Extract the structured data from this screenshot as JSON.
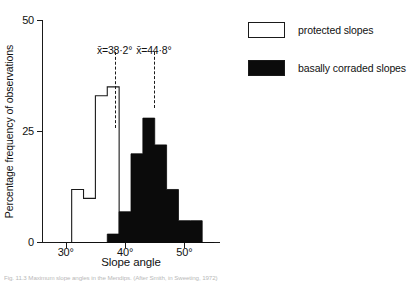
{
  "figure": {
    "caption": "Fig. 11.3  Maximum slope angles in the Mendips. (After Smith, in Sweeting, 1972)"
  },
  "axes": {
    "y_title": "Percentage frequency of observations",
    "x_title": "Slope angle",
    "y_ticks": [
      "0",
      "25",
      "50"
    ],
    "x_ticks": [
      "30°",
      "40°",
      "50°"
    ]
  },
  "annotations": {
    "mean_protected": {
      "symbol": "x̄",
      "eq": "=",
      "value": "38·2°",
      "full": "x̄=38·2°"
    },
    "mean_corraded": {
      "symbol": "x̄",
      "eq": "=",
      "value": "44·8°",
      "full": "x̄=44·8°"
    }
  },
  "legend": {
    "items": [
      {
        "label": "protected slopes",
        "swatch": "open",
        "color": "#ffffff"
      },
      {
        "label": "basally corraded slopes",
        "swatch": "filled",
        "color": "#0b0b0b"
      }
    ]
  },
  "chart_data": {
    "type": "bar",
    "subtype": "histogram",
    "title": "",
    "xlabel": "Slope angle",
    "ylabel": "Percentage frequency of observations",
    "xlim": [
      26,
      56
    ],
    "ylim": [
      0,
      50
    ],
    "ytick_values": [
      0,
      25,
      50
    ],
    "xtick_values": [
      30,
      40,
      50
    ],
    "xtick_labels": [
      "30°",
      "40°",
      "50°"
    ],
    "grid": false,
    "legend_position": "right-outside",
    "bin_width": 2,
    "bin_starts": [
      29,
      31,
      33,
      35,
      37,
      39,
      41,
      43,
      45,
      47,
      49,
      51,
      53
    ],
    "series": [
      {
        "name": "protected slopes",
        "color": "#ffffff",
        "edge_color": "#1a1a1a",
        "style": "outline",
        "mean": 38.2,
        "values": [
          0,
          12,
          10,
          33,
          35,
          0,
          0,
          0,
          0,
          0,
          0,
          0,
          0
        ]
      },
      {
        "name": "basally corraded slopes",
        "color": "#0b0b0b",
        "edge_color": "#0b0b0b",
        "style": "filled",
        "mean": 44.8,
        "values": [
          0,
          0,
          0,
          0,
          2,
          7,
          20,
          28,
          22,
          12,
          5,
          5,
          0
        ]
      }
    ],
    "annotations": [
      {
        "text": "x̄=38·2°",
        "x": 38.2,
        "type": "mean-line"
      },
      {
        "text": "x̄=44·8°",
        "x": 44.8,
        "type": "mean-line"
      }
    ]
  }
}
